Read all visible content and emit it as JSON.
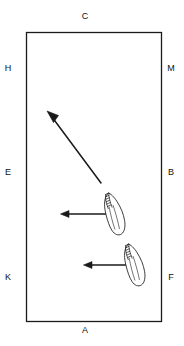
{
  "figure": {
    "type": "line-diagram",
    "background_color": "#ffffff",
    "ink_color": "#1a1a1a",
    "frame": {
      "name": "rectangular-plot-boundary",
      "x": 26,
      "y": 32,
      "width": 136,
      "height": 290,
      "stroke_width": 1.3
    },
    "labels": [
      {
        "text": "C",
        "position": "top-center",
        "x": 85,
        "y": 17
      },
      {
        "text": "H",
        "position": "left-upper",
        "x": 8,
        "y": 69
      },
      {
        "text": "M",
        "position": "right-upper",
        "x": 167,
        "y": 69
      },
      {
        "text": "E",
        "position": "left-middle",
        "x": 8,
        "y": 173
      },
      {
        "text": "B",
        "position": "right-middle",
        "x": 167,
        "y": 173
      },
      {
        "text": "K",
        "position": "left-lower",
        "x": 8,
        "y": 278
      },
      {
        "text": "F",
        "position": "right-lower",
        "x": 167,
        "y": 278
      },
      {
        "text": "A",
        "position": "bottom-center",
        "x": 85,
        "y": 331
      }
    ],
    "arrows": [
      {
        "name": "diagonal-arrow",
        "direction": "up-left",
        "x1": 101,
        "y1": 183,
        "x2": 48,
        "y2": 112
      },
      {
        "name": "upper-horizontal-arrow",
        "direction": "left",
        "x1": 114,
        "y1": 214,
        "x2": 61,
        "y2": 214
      },
      {
        "name": "lower-horizontal-arrow",
        "direction": "left",
        "x1": 134,
        "y1": 265,
        "x2": 84,
        "y2": 265
      }
    ],
    "leaf_shapes": [
      {
        "name": "upper-leaf-outline",
        "tip_x": 107,
        "tip_y": 194,
        "base_x": 120,
        "base_y": 238,
        "rotation_deg": 20
      },
      {
        "name": "lower-leaf-outline",
        "tip_x": 127,
        "tip_y": 245,
        "base_x": 140,
        "base_y": 289,
        "rotation_deg": 20
      }
    ]
  }
}
